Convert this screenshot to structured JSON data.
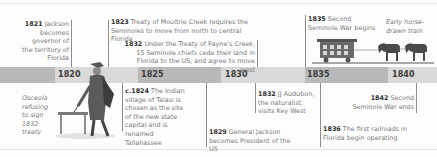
{
  "timeline": {
    "years": [
      "1820",
      "1825",
      "1830",
      "1835",
      "1840"
    ],
    "colors": {
      "band_dark": "#b9b9b9",
      "band_light": "#d9d9d9",
      "year_text": "#3a3a3a",
      "body_text": "#7a7a7a"
    },
    "events_above": [
      {
        "year": "1821",
        "text": "Jackson becomes governor of the territory of Florida"
      },
      {
        "year": "1823",
        "text": "Treaty of Moultrie Creek requires the Seminoles to move from north to central Florida"
      },
      {
        "year": "1832",
        "text": "Under the Treaty of Payne's Creek, 15 Seminole chiefs cede their land in Florida to the US, and agree to move west"
      },
      {
        "year": "1835",
        "text": "Second Seminole War begins"
      }
    ],
    "events_below": [
      {
        "year": "c.1824",
        "text": "The Indian village of Talasi is chosen as the site of the new state capital and is renamed Tallahassee"
      },
      {
        "year": "1829",
        "text": "General Jackson becomes President of the US"
      },
      {
        "year": "1832",
        "text": "JJ Audubon, the naturalist, visits Key West"
      },
      {
        "year": "1842",
        "text": "Second Seminole War ends"
      },
      {
        "year": "1836",
        "text": "The first railroads in Florida begin operating"
      }
    ],
    "captions": {
      "osceola": "Osceola refusing to sign 1832 treaty",
      "train": "Early horse-drawn train"
    },
    "illustrations": [
      "osceola-engraving",
      "horse-drawn-train-engraving"
    ]
  }
}
